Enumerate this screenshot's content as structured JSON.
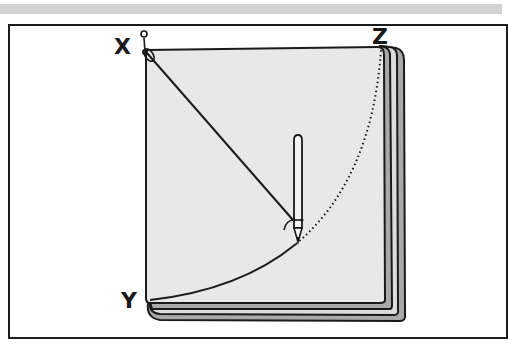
{
  "diagram": {
    "labels": {
      "x": "X",
      "y": "Y",
      "z": "Z"
    },
    "colors": {
      "paper_fill": "#e8e8e8",
      "back_sheet_fill": "#a9a9a9",
      "middle_sheet_fill": "#dcdcdc",
      "outline": "#1a1a1a",
      "top_bar": "#d2d2d2",
      "background": "#ffffff"
    },
    "elements": [
      "pin",
      "string",
      "pencil",
      "solid-arc",
      "dotted-arc",
      "stacked-paper"
    ]
  }
}
